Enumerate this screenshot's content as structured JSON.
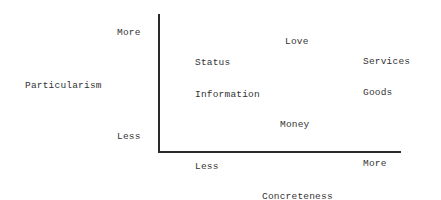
{
  "diagram": {
    "y_axis": {
      "title": "Particularism",
      "high_label": "More",
      "low_label": "Less"
    },
    "x_axis": {
      "title": "Concreteness",
      "low_label": "Less",
      "high_label": "More"
    },
    "resources": [
      {
        "label": "Love"
      },
      {
        "label": "Status"
      },
      {
        "label": "Services"
      },
      {
        "label": "Information"
      },
      {
        "label": "Goods"
      },
      {
        "label": "Money"
      }
    ]
  }
}
